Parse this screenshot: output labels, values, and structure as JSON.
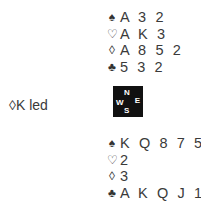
{
  "north": {
    "spades": "A 3 2",
    "hearts": "A K 3",
    "diamonds": "A 8 5 2",
    "clubs": "5 3 2"
  },
  "south": {
    "spades": "K Q 8 7 5",
    "hearts": "2",
    "diamonds": "3",
    "clubs": "A K Q J 10 6"
  },
  "suits": {
    "spade": "♠",
    "heart": "♡",
    "diamond": "◊",
    "club": "♣"
  },
  "compass": {
    "n": "N",
    "w": "W",
    "e": "E",
    "s": "S"
  },
  "lead": "◊K led"
}
